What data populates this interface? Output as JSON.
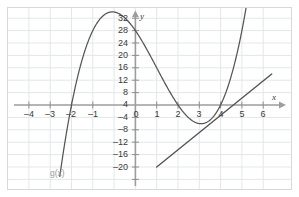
{
  "figure": {
    "kind": "coordinate-grid-graph",
    "background": "#ffffff",
    "frame_color": "#d8d8d8",
    "grid_color": "#e2e6ea",
    "axis_color": "#9d9d9d",
    "curve_color": "#555555",
    "label_color": "#3a3a3a",
    "function_label_color": "#9a9a9a"
  },
  "axes": {
    "x_name": "x",
    "y_name": "y",
    "x_min": -4.6,
    "x_max": 6.4,
    "y_min": -22,
    "y_max": 34,
    "x_ticks": [
      -4,
      -3,
      -2,
      -1,
      0,
      1,
      2,
      3,
      4,
      5,
      6
    ],
    "x_tick_labels": [
      "–4",
      "–3",
      "–2",
      "–1",
      "0",
      "1",
      "2",
      "3",
      "4",
      "5",
      "6"
    ],
    "y_ticks": [
      -20,
      -16,
      -12,
      -8,
      -4,
      4,
      8,
      12,
      16,
      20,
      24,
      28,
      32
    ],
    "y_tick_labels": [
      "–20",
      "–16",
      "–12",
      "–8",
      "–4",
      "4",
      "8",
      "12",
      "16",
      "20",
      "24",
      "28",
      "32"
    ],
    "x_grid_step": 1,
    "y_grid_step": 4,
    "grid": true,
    "x_arrow": true,
    "y_arrow": true
  },
  "annotations": {
    "function_label": "g(x)"
  },
  "chart_data": {
    "type": "line",
    "title": "",
    "xlabel": "x",
    "ylabel": "y",
    "xlim": [
      -4.6,
      6.4
    ],
    "ylim": [
      -22,
      34
    ],
    "grid": true,
    "legend": "none",
    "series": [
      {
        "name": "g(x)",
        "kind": "cubic",
        "expression": "g(x) = (x + 3)(x - 2)(x - 4)",
        "roots": [
          -3,
          2,
          4
        ],
        "y_intercept": 24,
        "local_max": {
          "x": -1.0,
          "y": 30
        },
        "local_min": {
          "x": 3.1,
          "y": -6
        },
        "label": "g(x)",
        "x": [
          -3.45,
          -3.2,
          -3.0,
          -2.75,
          -2.5,
          -2.25,
          -2.0,
          -1.75,
          -1.5,
          -1.25,
          -1.0,
          -0.75,
          -0.5,
          -0.25,
          0.0,
          0.25,
          0.5,
          0.75,
          1.0,
          1.25,
          1.5,
          1.75,
          2.0,
          2.25,
          2.5,
          2.75,
          3.0,
          3.25,
          3.5,
          3.75,
          4.0,
          4.25,
          4.5,
          4.75,
          5.0,
          5.2
        ],
        "y": [
          -15.0,
          -9.6,
          0.0,
          8.6,
          16.1,
          22.3,
          27.0,
          29.8,
          30.9,
          30.5,
          30.0,
          28.1,
          25.3,
          21.8,
          24.0,
          20.0,
          17.0,
          14.0,
          12.0,
          9.0,
          6.0,
          3.0,
          0.0,
          -2.5,
          -4.1,
          -5.6,
          -6.0,
          -5.9,
          -5.0,
          -2.9,
          0.0,
          4.4,
          10.1,
          17.1,
          24.0,
          32.0
        ]
      },
      {
        "name": "line",
        "kind": "linear",
        "expression": "y = 4x - 16",
        "slope": 4,
        "x_intercept": 4,
        "x": [
          1.0,
          6.4
        ],
        "y": [
          -20,
          10
        ]
      }
    ]
  }
}
